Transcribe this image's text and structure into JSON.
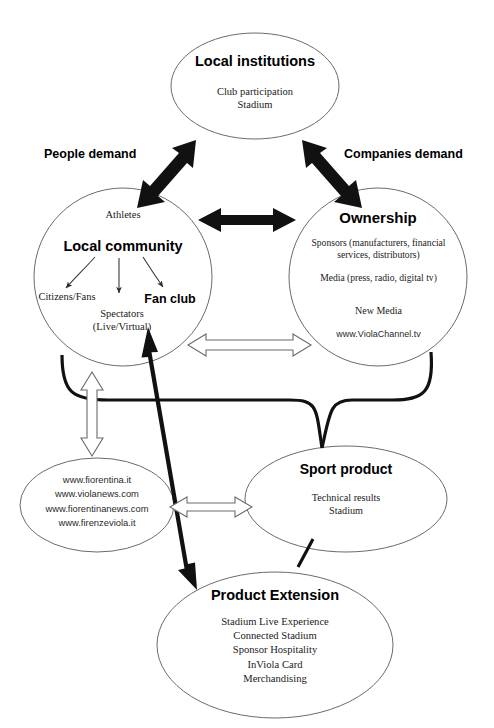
{
  "diagram": {
    "title_nodes": {
      "local_institutions": {
        "heading": "Local institutions",
        "lines": "Club participation\nStadium"
      },
      "local_community": {
        "top_label": "Athletes",
        "heading": "Local community",
        "branch_left": "Citizens/Fans",
        "branch_center": "Spectators\n(Live/Virtual)",
        "branch_right": "Fan club"
      },
      "ownership": {
        "heading": "Ownership",
        "sponsors": "Sponsors (manufacturers, financial\nservices, distributors)",
        "media": "Media (press, radio, digital tv)",
        "new_media": "New Media",
        "channel": "www.ViolaChannel.tv"
      },
      "websites": {
        "lines": "www.fiorentina.it\nwww.violanews.com\nwww.fiorentinanews.com\nwww.firenzeviola.it"
      },
      "sport_product": {
        "heading": "Sport product",
        "lines": "Technical results\nStadium"
      },
      "product_extension": {
        "heading": "Product Extension",
        "lines": "Stadium Live Experience\nConnected Stadium\nSponsor Hospitality\nInViola Card\nMerchandising"
      }
    },
    "edge_labels": {
      "people_demand": "People demand",
      "companies_demand": "Companies demand"
    },
    "colors": {
      "outline": "#6b6b6b",
      "arrow_solid": "#111111",
      "arrow_hollow_fill": "#ffffff",
      "text": "#111111",
      "background": "#ffffff"
    }
  }
}
